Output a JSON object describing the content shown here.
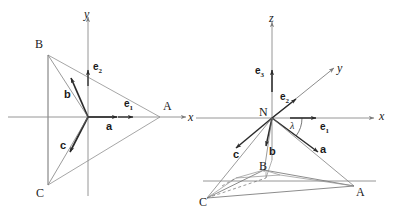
{
  "figure": {
    "type": "geometry-diagram",
    "stroke_color": "#333333",
    "thin_color": "#8a8a8a",
    "label_color": "#1a1a1a",
    "background": "#ffffff"
  },
  "left_panel": {
    "name": "2D plane diagram",
    "origin": {
      "x": 88,
      "y": 117
    },
    "axes": [
      {
        "id": "x",
        "label": "x",
        "label_x": 188,
        "label_y": 111,
        "direction": "right"
      },
      {
        "id": "y",
        "label": "y",
        "label_x": 84,
        "label_y": 8,
        "direction": "up"
      }
    ],
    "points": [
      {
        "id": "A",
        "label": "A",
        "x": 160,
        "y": 117,
        "label_x": 163,
        "label_y": 100
      },
      {
        "id": "B",
        "label": "B",
        "x": 48,
        "y": 55,
        "label_x": 35,
        "label_y": 38
      },
      {
        "id": "C",
        "label": "C",
        "x": 48,
        "y": 185,
        "label_x": 36,
        "label_y": 187
      }
    ],
    "basis_vectors": [
      {
        "id": "e1",
        "label": "e",
        "sub": "1",
        "label_x": 124,
        "label_y": 99,
        "tip_x": 133,
        "tip_y": 117
      },
      {
        "id": "e2",
        "label": "e",
        "sub": "2",
        "label_x": 93,
        "label_y": 62,
        "tip_x": 88,
        "tip_y": 72
      }
    ],
    "position_vectors": [
      {
        "id": "a",
        "label": "a",
        "label_x": 106,
        "label_y": 121,
        "tip_x": 118,
        "tip_y": 117
      },
      {
        "id": "b",
        "label": "b",
        "label_x": 64,
        "label_y": 89,
        "tip_x": 72,
        "tip_y": 76
      },
      {
        "id": "c",
        "label": "c",
        "label_x": 60,
        "label_y": 140,
        "tip_x": 70,
        "tip_y": 154
      }
    ]
  },
  "right_panel": {
    "name": "3D perspective diagram",
    "origin": {
      "id": "N",
      "label": "N",
      "x": 272,
      "y": 118,
      "label_x": 259,
      "label_y": 106
    },
    "axes": [
      {
        "id": "x",
        "label": "x",
        "label_x": 379,
        "label_y": 110,
        "direction": "right"
      },
      {
        "id": "y",
        "label": "y",
        "label_x": 337,
        "label_y": 62,
        "direction": "oblique-up-right"
      },
      {
        "id": "z",
        "label": "z",
        "label_x": 269,
        "label_y": 12,
        "direction": "up"
      }
    ],
    "angle": {
      "id": "lambda",
      "label": "λ",
      "label_x": 290,
      "label_y": 121
    },
    "basis_vectors": [
      {
        "id": "e1",
        "label": "e",
        "sub": "1",
        "label_x": 320,
        "label_y": 122
      },
      {
        "id": "e2",
        "label": "e",
        "sub": "2",
        "label_x": 280,
        "label_y": 92
      },
      {
        "id": "e3",
        "label": "e",
        "sub": "3",
        "label_x": 255,
        "label_y": 66
      }
    ],
    "position_vectors": [
      {
        "id": "a",
        "label": "a",
        "label_x": 320,
        "label_y": 144
      },
      {
        "id": "b",
        "label": "b",
        "label_x": 269,
        "label_y": 146
      },
      {
        "id": "c",
        "label": "c",
        "label_x": 233,
        "label_y": 149
      }
    ],
    "points": [
      {
        "id": "A",
        "label": "A",
        "x": 354,
        "y": 186,
        "label_x": 356,
        "label_y": 186
      },
      {
        "id": "B",
        "label": "B",
        "x": 264,
        "y": 170,
        "label_x": 259,
        "label_y": 160
      },
      {
        "id": "C",
        "label": "C",
        "x": 207,
        "y": 198,
        "label_x": 199,
        "label_y": 196
      }
    ]
  }
}
